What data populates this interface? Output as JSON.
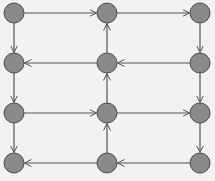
{
  "diagram": {
    "type": "directed-grid-graph",
    "background": "#f2f2f0",
    "node_fill": "#8a8a8a",
    "node_stroke": "#4a4a4a",
    "edge_color": "#555555",
    "node_radius": 10,
    "columns_x": [
      14,
      107,
      200
    ],
    "rows_y": [
      13,
      63,
      113,
      163
    ],
    "nodes": [
      {
        "id": "n00",
        "row": 0,
        "col": 0
      },
      {
        "id": "n01",
        "row": 0,
        "col": 1
      },
      {
        "id": "n02",
        "row": 0,
        "col": 2
      },
      {
        "id": "n10",
        "row": 1,
        "col": 0
      },
      {
        "id": "n11",
        "row": 1,
        "col": 1
      },
      {
        "id": "n12",
        "row": 1,
        "col": 2
      },
      {
        "id": "n20",
        "row": 2,
        "col": 0
      },
      {
        "id": "n21",
        "row": 2,
        "col": 1
      },
      {
        "id": "n22",
        "row": 2,
        "col": 2
      },
      {
        "id": "n30",
        "row": 3,
        "col": 0
      },
      {
        "id": "n31",
        "row": 3,
        "col": 1
      },
      {
        "id": "n32",
        "row": 3,
        "col": 2
      }
    ],
    "edges": [
      {
        "from": "n00",
        "to": "n01"
      },
      {
        "from": "n01",
        "to": "n02"
      },
      {
        "from": "n02",
        "to": "n12"
      },
      {
        "from": "n12",
        "to": "n11"
      },
      {
        "from": "n11",
        "to": "n01"
      },
      {
        "from": "n11",
        "to": "n10"
      },
      {
        "from": "n00",
        "to": "n10"
      },
      {
        "from": "n10",
        "to": "n20"
      },
      {
        "from": "n20",
        "to": "n21"
      },
      {
        "from": "n21",
        "to": "n11"
      },
      {
        "from": "n21",
        "to": "n22"
      },
      {
        "from": "n12",
        "to": "n22"
      },
      {
        "from": "n22",
        "to": "n32"
      },
      {
        "from": "n32",
        "to": "n31"
      },
      {
        "from": "n31",
        "to": "n21"
      },
      {
        "from": "n20",
        "to": "n30"
      },
      {
        "from": "n31",
        "to": "n30"
      }
    ]
  }
}
